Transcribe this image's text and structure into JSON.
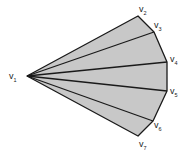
{
  "diagram": {
    "type": "polygon-fan-triangulation",
    "fill_color": "#c8c8c8",
    "stroke_color": "#1a1a1a",
    "apex": {
      "id": "v1",
      "label": "v",
      "sub": "1",
      "x": 27,
      "y": 76,
      "lx": 9,
      "ly": 79
    },
    "vertices": [
      {
        "id": "v2",
        "label": "v",
        "sub": "2",
        "x": 138,
        "y": 16,
        "lx": 139,
        "ly": 12
      },
      {
        "id": "v3",
        "label": "v",
        "sub": "3",
        "x": 154,
        "y": 32,
        "lx": 154,
        "ly": 28
      },
      {
        "id": "v4",
        "label": "v",
        "sub": "4",
        "x": 167,
        "y": 62,
        "lx": 170,
        "ly": 62
      },
      {
        "id": "v5",
        "label": "v",
        "sub": "5",
        "x": 167,
        "y": 91,
        "lx": 170,
        "ly": 94
      },
      {
        "id": "v6",
        "label": "v",
        "sub": "6",
        "x": 153,
        "y": 121,
        "lx": 154,
        "ly": 128
      },
      {
        "id": "v7",
        "label": "v",
        "sub": "7",
        "x": 138,
        "y": 136,
        "lx": 139,
        "ly": 147
      }
    ]
  }
}
